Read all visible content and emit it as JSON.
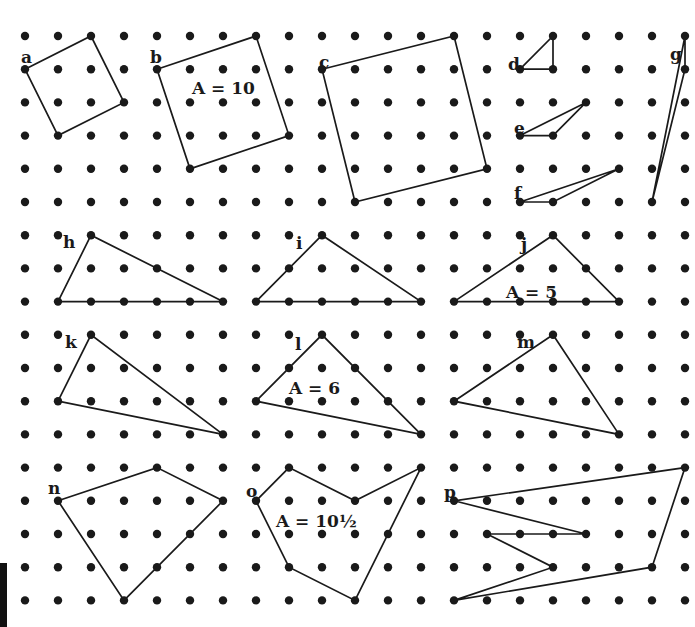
{
  "diagram": {
    "type": "geoboard-dot-grid",
    "grid": {
      "columns": 21,
      "rows": 18,
      "origin_x": 25,
      "origin_y": 36,
      "spacing_x": 33,
      "spacing_y": 33.2,
      "dot_radius": 4.2,
      "dot_color": "#1a1a1a"
    },
    "line_color": "#1a1a1a",
    "polygons": [
      {
        "label": "a",
        "vertices": [
          [
            0,
            1
          ],
          [
            2,
            0
          ],
          [
            3,
            2
          ],
          [
            1,
            3
          ]
        ],
        "label_pos": [
          21,
          63
        ]
      },
      {
        "label": "b",
        "vertices": [
          [
            4,
            1
          ],
          [
            7,
            0
          ],
          [
            8,
            3
          ],
          [
            5,
            4
          ]
        ],
        "label_pos": [
          150,
          63
        ],
        "area_text": "A = 10",
        "area_pos": [
          192,
          94
        ]
      },
      {
        "label": "c",
        "vertices": [
          [
            9,
            1
          ],
          [
            13,
            0
          ],
          [
            14,
            4
          ],
          [
            10,
            5
          ]
        ],
        "label_pos": [
          319,
          68
        ]
      },
      {
        "label": "d",
        "vertices": [
          [
            15,
            1
          ],
          [
            16,
            0
          ],
          [
            16,
            1
          ]
        ],
        "label_pos": [
          508,
          70
        ]
      },
      {
        "label": "e",
        "vertices": [
          [
            15,
            3
          ],
          [
            17,
            2
          ],
          [
            16,
            3
          ]
        ],
        "label_pos": [
          514,
          134
        ]
      },
      {
        "label": "f",
        "vertices": [
          [
            15,
            5
          ],
          [
            18,
            4
          ],
          [
            16,
            5
          ]
        ],
        "label_pos": [
          514,
          199
        ]
      },
      {
        "label": "g",
        "vertices": [
          [
            20,
            0
          ],
          [
            20,
            1
          ],
          [
            19,
            5
          ]
        ],
        "label_pos": [
          670,
          60
        ]
      },
      {
        "label": "h",
        "vertices": [
          [
            1,
            8
          ],
          [
            2,
            6
          ],
          [
            6,
            8
          ]
        ],
        "label_pos": [
          63,
          248
        ]
      },
      {
        "label": "i",
        "vertices": [
          [
            7,
            8
          ],
          [
            9,
            6
          ],
          [
            12,
            8
          ]
        ],
        "label_pos": [
          296,
          249
        ]
      },
      {
        "label": "j",
        "vertices": [
          [
            13,
            8
          ],
          [
            16,
            6
          ],
          [
            18,
            8
          ]
        ],
        "label_pos": [
          521,
          250
        ],
        "area_text": "A = 5",
        "area_pos": [
          506,
          298
        ]
      },
      {
        "label": "k",
        "vertices": [
          [
            1,
            11
          ],
          [
            2,
            9
          ],
          [
            6,
            12
          ]
        ],
        "label_pos": [
          65,
          348
        ]
      },
      {
        "label": "l",
        "vertices": [
          [
            7,
            11
          ],
          [
            9,
            9
          ],
          [
            12,
            12
          ]
        ],
        "label_pos": [
          295,
          350
        ],
        "area_text": "A = 6",
        "area_pos": [
          289,
          394
        ]
      },
      {
        "label": "m",
        "vertices": [
          [
            13,
            11
          ],
          [
            16,
            9
          ],
          [
            18,
            12
          ]
        ],
        "label_pos": [
          517,
          348
        ]
      },
      {
        "label": "n",
        "vertices": [
          [
            1,
            14
          ],
          [
            4,
            13
          ],
          [
            6,
            14
          ],
          [
            3,
            17
          ]
        ],
        "label_pos": [
          48,
          494
        ]
      },
      {
        "label": "o",
        "vertices": [
          [
            7,
            14
          ],
          [
            8,
            13
          ],
          [
            10,
            14
          ],
          [
            12,
            13
          ],
          [
            10,
            17
          ],
          [
            8,
            16
          ]
        ],
        "label_pos": [
          246,
          497
        ],
        "area_text": "A = 10½",
        "area_pos": [
          276,
          527
        ]
      },
      {
        "label": "p",
        "vertices": [
          [
            13,
            14
          ],
          [
            20,
            13
          ],
          [
            19,
            16
          ],
          [
            13,
            17
          ],
          [
            16,
            16
          ],
          [
            14,
            15
          ],
          [
            17,
            15
          ]
        ],
        "label_pos": [
          444,
          498
        ]
      }
    ]
  }
}
